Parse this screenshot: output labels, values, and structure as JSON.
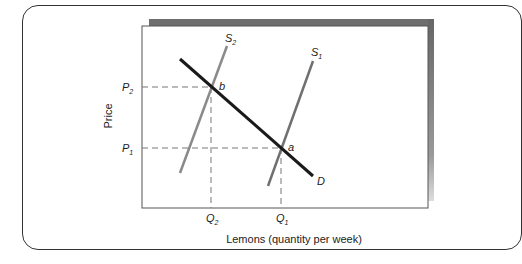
{
  "diagram": {
    "type": "supply-demand",
    "axes": {
      "ylabel": "Price",
      "xlabel": "Lemons (quantity per week)"
    },
    "price_ticks": [
      {
        "label": "P",
        "sub": "2",
        "point": "b"
      },
      {
        "label": "P",
        "sub": "1",
        "point": "a"
      }
    ],
    "quantity_ticks": [
      {
        "label": "Q",
        "sub": "2",
        "point": "b"
      },
      {
        "label": "Q",
        "sub": "1",
        "point": "a"
      }
    ],
    "curves": [
      {
        "name": "D",
        "label": "D",
        "sub": "",
        "kind": "demand",
        "color": "#1a1a1a"
      },
      {
        "name": "S1",
        "label": "S",
        "sub": "1",
        "kind": "supply",
        "color": "#707070"
      },
      {
        "name": "S2",
        "label": "S",
        "sub": "2",
        "kind": "supply",
        "color": "#8a8a8a"
      }
    ],
    "points": [
      {
        "label": "a",
        "description": "intersection of D and S1 at (Q1, P1)"
      },
      {
        "label": "b",
        "description": "intersection of D and S2 at (Q2, P2)"
      }
    ],
    "colors": {
      "frame_shadow": "#6e6e6e",
      "axis": "#555555",
      "guide": "#777777"
    }
  }
}
